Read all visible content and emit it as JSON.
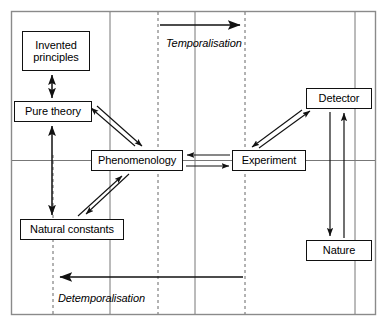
{
  "diagram": {
    "frame": {
      "stroke": "#8a8a8a"
    },
    "line_color": "#111111",
    "nodes": [
      {
        "id": "invented-principles",
        "label": "Invented\nprinciples",
        "x": 22,
        "y": 31,
        "w": 68,
        "h": 40
      },
      {
        "id": "pure-theory",
        "label": "Pure theory",
        "x": 14,
        "y": 101,
        "w": 78,
        "h": 21
      },
      {
        "id": "phenomenology",
        "label": "Phenomenology",
        "x": 91,
        "y": 150,
        "w": 92,
        "h": 21
      },
      {
        "id": "natural-constants",
        "label": "Natural constants",
        "x": 20,
        "y": 219,
        "w": 104,
        "h": 21
      },
      {
        "id": "experiment",
        "label": "Experiment",
        "x": 232,
        "y": 150,
        "w": 74,
        "h": 21
      },
      {
        "id": "detector",
        "label": "Detector",
        "x": 306,
        "y": 88,
        "w": 66,
        "h": 21
      },
      {
        "id": "nature",
        "label": "Nature",
        "x": 306,
        "y": 240,
        "w": 66,
        "h": 21
      }
    ],
    "zone_labels": [
      {
        "id": "temporalisation",
        "text": "Temporalisation",
        "x": 166,
        "y": 37
      },
      {
        "id": "detemporalisation",
        "text": "Detemporalisation",
        "x": 58,
        "y": 292
      }
    ],
    "edges": [
      {
        "id": "invented-principles--pure-theory",
        "type": "double-vertical"
      },
      {
        "id": "pure-theory--natural-constants",
        "type": "double-vertical"
      },
      {
        "id": "pure-theory--phenomenology",
        "type": "double-diagonal"
      },
      {
        "id": "phenomenology--natural-constants",
        "type": "double-diagonal"
      },
      {
        "id": "phenomenology--experiment",
        "type": "two-parallel-horizontal"
      },
      {
        "id": "experiment--detector",
        "type": "two-parallel-diagonal"
      },
      {
        "id": "detector--nature",
        "type": "two-parallel-vertical"
      },
      {
        "id": "temporalisation-arrow",
        "type": "arrow-right"
      },
      {
        "id": "detemporalisation-arrow",
        "type": "arrow-left"
      }
    ],
    "guides": {
      "dashed_vertical_x": [
        53,
        158,
        245
      ],
      "solid_vertical_x": [
        110,
        195,
        355
      ],
      "solid_horizontal_y": [
        160
      ],
      "note": "dashed columns delimit the temporalisation / detemporalisation bands"
    }
  }
}
